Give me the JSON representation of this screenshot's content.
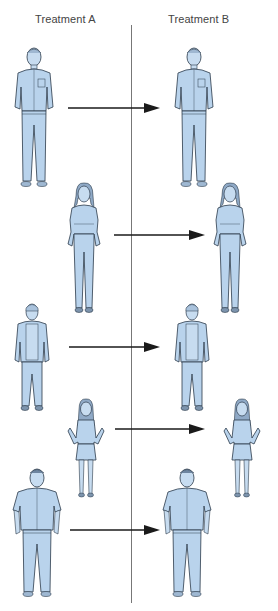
{
  "headers": {
    "treatment_a": "Treatment A",
    "treatment_b": "Treatment B"
  },
  "colors": {
    "clothing_fill": "#b9d3ec",
    "skin_fill": "#c7dcf0",
    "outline": "#2b3a4a",
    "arrow": "#1a1a1a",
    "divider": "#777777",
    "header_text": "#444444"
  },
  "subjects": [
    {
      "id": "adult-man",
      "description": "Man in work shirt with pocket, hands in pockets",
      "treatment_a_position": [
        12,
        45
      ],
      "treatment_b_position": [
        172,
        45
      ]
    },
    {
      "id": "young-woman",
      "description": "Woman with long hair, hands in jean pockets",
      "treatment_a_position": [
        64,
        182
      ],
      "treatment_b_position": [
        210,
        182
      ]
    },
    {
      "id": "teen-boy",
      "description": "Teen boy in open jacket and pants",
      "treatment_a_position": [
        14,
        302
      ],
      "treatment_b_position": [
        174,
        302
      ]
    },
    {
      "id": "girl",
      "description": "Girl with hands on hips wearing skirt",
      "treatment_a_position": [
        66,
        398
      ],
      "treatment_b_position": [
        222,
        398
      ]
    },
    {
      "id": "older-man",
      "description": "Older man in short-sleeve shirt, arms at sides",
      "treatment_a_position": [
        12,
        466
      ],
      "treatment_b_position": [
        162,
        466
      ]
    }
  ],
  "arrows": [
    {
      "from_x": 68,
      "to_x": 160,
      "y": 108
    },
    {
      "from_x": 114,
      "to_x": 205,
      "y": 235
    },
    {
      "from_x": 69,
      "to_x": 160,
      "y": 347
    },
    {
      "from_x": 115,
      "to_x": 205,
      "y": 429
    },
    {
      "from_x": 70,
      "to_x": 160,
      "y": 530
    }
  ]
}
